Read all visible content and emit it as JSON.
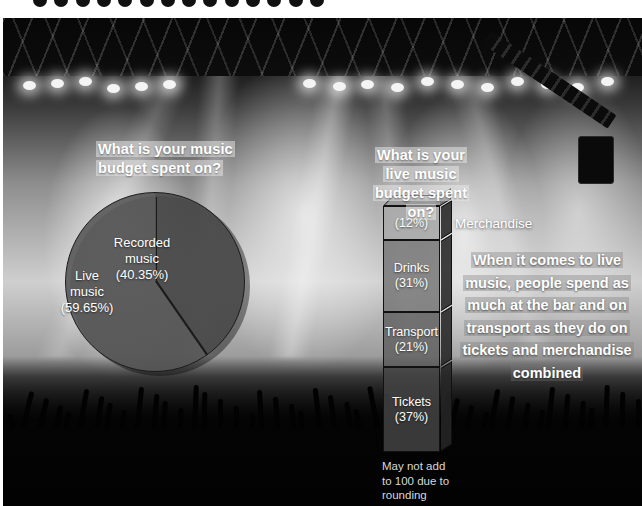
{
  "decor": {
    "scallop_dot_color": "#111111",
    "scallop_dot_count": 14
  },
  "titles": {
    "left": "What is your music budget spent on?",
    "right": "What is your live music budget spent on?"
  },
  "chart_data": [
    {
      "type": "pie",
      "title": "What is your music budget spent on?",
      "categories": [
        "Live music",
        "Recorded music"
      ],
      "values": [
        59.65,
        40.35
      ],
      "labels": [
        "Live music (59.65%)",
        "Recorded music (40.35%)"
      ],
      "unit": "%",
      "legend": "none",
      "slice_colors": [
        "#4a4a4a",
        "#585858"
      ],
      "label_color": "#ffffff"
    },
    {
      "type": "bar",
      "subtype": "stacked-3d-single-column",
      "title": "What is your live music budget spent on?",
      "categories": [
        "Merchandise",
        "Drinks",
        "Transport",
        "Tickets"
      ],
      "values": [
        12,
        31,
        21,
        37
      ],
      "unit": "%",
      "ylim": [
        0,
        101
      ],
      "grid": false,
      "note": "May not add to 100 due to rounding",
      "segment_colors": [
        "#a8a8a8",
        "#767676",
        "#606060",
        "#444444"
      ]
    }
  ],
  "pie": {
    "recorded": {
      "name": "Recorded",
      "name2": "music",
      "pct": "(40.35%)"
    },
    "live": {
      "name": "Live",
      "name2": "music",
      "pct": "(59.65%)"
    }
  },
  "bar": {
    "merchandise": {
      "label": "",
      "pct": "(12%)"
    },
    "drinks": {
      "label": "Drinks",
      "pct": "(31%)"
    },
    "transport": {
      "label": "Transport",
      "pct": "(21%)"
    },
    "tickets": {
      "label": "Tickets",
      "pct": "(37%)"
    },
    "external_label": "Merchandise",
    "footnote_l1": "May not add",
    "footnote_l2": "to 100 due to",
    "footnote_l3": "rounding"
  },
  "callout": {
    "text": "When it comes to live music, people spend as much at the bar and on transport as they do on tickets and merchandise combined"
  }
}
